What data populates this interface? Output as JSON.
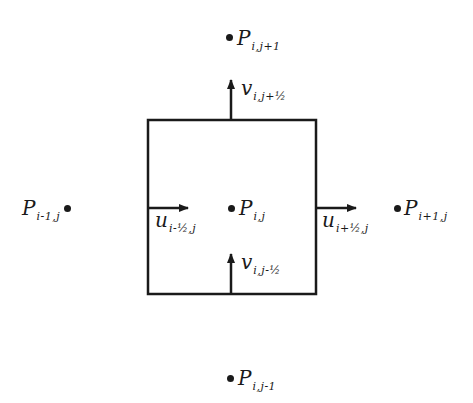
{
  "diagram": {
    "type": "staggered-grid-control-volume",
    "colors": {
      "ink": "#1a1a1a",
      "background": "#ffffff"
    },
    "cell": {
      "x": 148,
      "y": 120,
      "width": 168,
      "height": 174
    },
    "pressure_nodes": [
      {
        "id": "center",
        "main": "P",
        "sub": "i,j"
      },
      {
        "id": "north",
        "main": "P",
        "sub": "i,j+1"
      },
      {
        "id": "south",
        "main": "P",
        "sub": "i,j-1"
      },
      {
        "id": "west",
        "main": "P",
        "sub": "i-1,j"
      },
      {
        "id": "east",
        "main": "P",
        "sub": "i+1,j"
      }
    ],
    "velocity_nodes": [
      {
        "id": "u-west",
        "main": "u",
        "sub": "i-½,j"
      },
      {
        "id": "u-east",
        "main": "u",
        "sub": "i+½,j"
      },
      {
        "id": "v-north",
        "main": "v",
        "sub": "i,j+½"
      },
      {
        "id": "v-south",
        "main": "v",
        "sub": "i,j-½"
      }
    ]
  }
}
